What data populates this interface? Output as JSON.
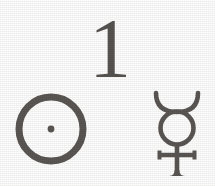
{
  "plate": {
    "title": "Astronomical symbol plate",
    "background_color": "#fefefe",
    "ink_color": "#5a5653",
    "width": 215,
    "height": 186
  },
  "figures": [
    {
      "id": "numeral-one",
      "kind": "numeral",
      "glyph": "1",
      "label": "1",
      "semantic_name": "numeral-one",
      "x": 96,
      "y": 20,
      "width": 28,
      "height": 68
    },
    {
      "id": "sun-symbol",
      "kind": "symbol",
      "glyph": "☉",
      "label": "Sun",
      "semantic_name": "sun-symbol",
      "description": "circle with central dot",
      "x": 15,
      "y": 94,
      "width": 70,
      "height": 70
    },
    {
      "id": "mercury-symbol",
      "kind": "symbol",
      "glyph": "☿",
      "label": "Mercury",
      "semantic_name": "mercury-symbol",
      "description": "circle with horns above and cross below",
      "x": 153,
      "y": 93,
      "width": 44,
      "height": 80
    }
  ]
}
